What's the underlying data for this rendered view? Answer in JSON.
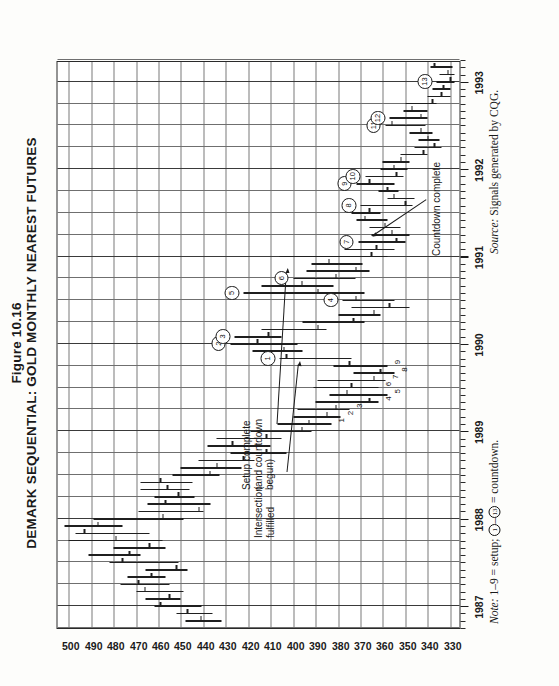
{
  "figure": {
    "number_label": "Figure 10.16",
    "title": "DEMARK SEQUENTIAL: GOLD MONTHLY NEAREST FUTURES",
    "note_prefix": "Note:",
    "note_text": " 1–9 = setup; ①–⑬ = countdown.",
    "note_seg_a": " 1–9 = setup; ",
    "note_seg_b": "1",
    "note_seg_c": "–",
    "note_seg_d": "13",
    "note_seg_e": " = countdown.",
    "source_prefix": "Source:",
    "source_text": " Signals generated by CQG."
  },
  "annotations": [
    {
      "id": "intersection",
      "lines": "Intersection\nfulfilled"
    },
    {
      "id": "setup-complete",
      "lines": "Setup complete\n(and countdown\nbegun)"
    },
    {
      "id": "countdown-complete",
      "lines": "Countdown complete"
    }
  ],
  "chart_data": {
    "type": "bar",
    "chart_subtype": "ohlc-bar",
    "title": "DEMARK SEQUENTIAL: GOLD MONTHLY NEAREST FUTURES",
    "xlabel": "",
    "ylabel": "",
    "grid": true,
    "legend": "none",
    "orientation": "rotated-90-ccw",
    "ylim": [
      325,
      505
    ],
    "ytick_step": 10,
    "yticks": [
      500,
      490,
      480,
      470,
      460,
      450,
      440,
      430,
      420,
      410,
      400,
      390,
      380,
      370,
      360,
      350,
      340,
      330
    ],
    "xlim": [
      "1986-10",
      "1993-04"
    ],
    "xticks": [
      "1987",
      "1988",
      "1989",
      "1990",
      "1991",
      "1992",
      "1993"
    ],
    "xtick_minor": "monthly",
    "series": [
      {
        "name": "Gold Monthly Nearest Futures (OHLC)",
        "fields": [
          "month",
          "high",
          "low",
          "close"
        ],
        "values": [
          [
            "1986-11",
            448,
            432,
            441
          ],
          [
            "1986-12",
            452,
            436,
            447
          ],
          [
            "1987-01",
            462,
            441,
            459
          ],
          [
            "1987-02",
            466,
            450,
            455
          ],
          [
            "1987-03",
            470,
            449,
            466
          ],
          [
            "1987-04",
            477,
            455,
            469
          ],
          [
            "1987-05",
            474,
            457,
            463
          ],
          [
            "1987-06",
            466,
            447,
            452
          ],
          [
            "1987-07",
            482,
            451,
            476
          ],
          [
            "1987-08",
            491,
            468,
            473
          ],
          [
            "1987-09",
            480,
            457,
            464
          ],
          [
            "1987-10",
            500,
            458,
            479
          ],
          [
            "1987-11",
            497,
            464,
            493
          ],
          [
            "1987-12",
            502,
            476,
            487
          ],
          [
            "1988-01",
            489,
            449,
            458
          ],
          [
            "1988-02",
            469,
            440,
            442
          ],
          [
            "1988-03",
            465,
            437,
            457
          ],
          [
            "1988-04",
            462,
            444,
            451
          ],
          [
            "1988-05",
            468,
            446,
            456
          ],
          [
            "1988-06",
            468,
            445,
            459
          ],
          [
            "1988-07",
            454,
            433,
            437
          ],
          [
            "1988-08",
            450,
            423,
            434
          ],
          [
            "1988-09",
            442,
            417,
            422
          ],
          [
            "1988-10",
            428,
            403,
            412
          ],
          [
            "1988-11",
            438,
            410,
            427
          ],
          [
            "1988-12",
            434,
            405,
            412
          ],
          [
            "1989-01",
            419,
            392,
            396
          ],
          [
            "1989-02",
            407,
            383,
            393
          ],
          [
            "1989-03",
            400,
            379,
            385
          ],
          [
            "1989-04",
            398,
            375,
            381
          ],
          [
            "1989-05",
            390,
            362,
            366
          ],
          [
            "1989-06",
            384,
            358,
            376
          ],
          [
            "1989-07",
            391,
            362,
            374
          ],
          [
            "1989-08",
            389,
            359,
            364
          ],
          [
            "1989-09",
            373,
            355,
            361
          ],
          [
            "1989-10",
            382,
            358,
            375
          ],
          [
            "1989-11",
            406,
            374,
            403
          ],
          [
            "1989-12",
            418,
            396,
            404
          ],
          [
            "1990-01",
            428,
            398,
            416
          ],
          [
            "1990-02",
            426,
            405,
            411
          ],
          [
            "1990-03",
            414,
            385,
            389
          ],
          [
            "1990-04",
            396,
            368,
            373
          ],
          [
            "1990-05",
            380,
            361,
            364
          ],
          [
            "1990-06",
            374,
            348,
            357
          ],
          [
            "1990-07",
            378,
            355,
            372
          ],
          [
            "1990-08",
            422,
            368,
            389
          ],
          [
            "1990-09",
            414,
            382,
            396
          ],
          [
            "1990-10",
            400,
            372,
            381
          ],
          [
            "1990-11",
            394,
            366,
            372
          ],
          [
            "1990-12",
            392,
            369,
            384
          ],
          [
            "1991-01",
            406,
            358,
            365
          ],
          [
            "1991-02",
            377,
            355,
            363
          ],
          [
            "1991-03",
            371,
            350,
            354
          ],
          [
            "1991-04",
            365,
            348,
            356
          ],
          [
            "1991-05",
            366,
            352,
            359
          ],
          [
            "1991-06",
            372,
            358,
            368
          ],
          [
            "1991-07",
            374,
            361,
            366
          ],
          [
            "1991-08",
            370,
            347,
            350
          ],
          [
            "1991-09",
            358,
            346,
            355
          ],
          [
            "1991-10",
            362,
            353,
            358
          ],
          [
            "1991-11",
            372,
            355,
            366
          ],
          [
            "1991-12",
            368,
            351,
            354
          ],
          [
            "1992-01",
            361,
            349,
            355
          ],
          [
            "1992-02",
            360,
            348,
            352
          ],
          [
            "1992-03",
            352,
            340,
            342
          ],
          [
            "1992-04",
            346,
            334,
            337
          ],
          [
            "1992-05",
            344,
            335,
            340
          ],
          [
            "1992-06",
            348,
            338,
            343
          ],
          [
            "1992-07",
            359,
            341,
            356
          ],
          [
            "1992-08",
            357,
            340,
            343
          ],
          [
            "1992-09",
            351,
            340,
            347
          ],
          [
            "1992-10",
            350,
            336,
            338
          ],
          [
            "1992-11",
            340,
            330,
            334
          ],
          [
            "1992-12",
            338,
            330,
            333
          ],
          [
            "1993-01",
            336,
            328,
            330
          ],
          [
            "1993-02",
            335,
            328,
            331
          ],
          [
            "1993-03",
            339,
            329,
            337
          ]
        ]
      }
    ],
    "setup_markers": [
      {
        "label": "1",
        "month": "1989-02"
      },
      {
        "label": "2",
        "month": "1989-03"
      },
      {
        "label": "3",
        "month": "1989-04"
      },
      {
        "label": "4",
        "month": "1989-05"
      },
      {
        "label": "5",
        "month": "1989-06"
      },
      {
        "label": "6",
        "month": "1989-07"
      },
      {
        "label": "7",
        "month": "1989-08"
      },
      {
        "label": "8",
        "month": "1989-09"
      },
      {
        "label": "9",
        "month": "1989-10"
      }
    ],
    "countdown_markers": [
      {
        "label": "1",
        "month": "1989-11"
      },
      {
        "label": "2",
        "month": "1990-01"
      },
      {
        "label": "3",
        "month": "1990-02"
      },
      {
        "label": "4",
        "month": "1990-07"
      },
      {
        "label": "5",
        "month": "1990-08"
      },
      {
        "label": "6",
        "month": "1990-10"
      },
      {
        "label": "7",
        "month": "1991-03"
      },
      {
        "label": "8",
        "month": "1991-08"
      },
      {
        "label": "9",
        "month": "1991-11"
      },
      {
        "label": "10",
        "month": "1991-12"
      },
      {
        "label": "11",
        "month": "1992-07"
      },
      {
        "label": "12",
        "month": "1992-08"
      },
      {
        "label": "13",
        "month": "1993-01"
      }
    ]
  }
}
